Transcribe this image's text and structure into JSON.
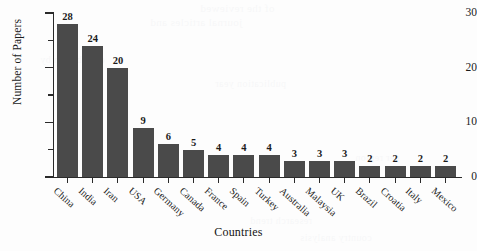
{
  "chart_data": {
    "type": "bar",
    "title": "",
    "xlabel": "Countries",
    "ylabel": "Number of Papers",
    "categories": [
      "China",
      "India",
      "Iran",
      "USA",
      "Germany",
      "Canada",
      "France",
      "Spain",
      "Turkey",
      "Australia",
      "Malaysia",
      "UK",
      "Brazil",
      "Croatia",
      "Italy",
      "Mexico"
    ],
    "values": [
      28,
      24,
      20,
      9,
      6,
      5,
      4,
      4,
      4,
      3,
      3,
      3,
      2,
      2,
      2,
      2
    ],
    "ylim": [
      0,
      30
    ],
    "y_major_ticks": [
      0,
      10,
      20,
      30
    ],
    "y_minor_ticks": [
      5,
      15,
      25
    ],
    "y_tick_labels": [
      "0",
      "10",
      "20",
      "30"
    ],
    "data_labels_shown": true,
    "grid": false,
    "legend": false,
    "bar_color": "#4a4a4a",
    "axis_color": "#2a2a2a",
    "text_color": "#1b1b1b",
    "background_color": "#fdfdfd"
  },
  "bleed_through": {
    "line1": "of the reviewed",
    "line2": "journal articles and",
    "line3": "distribution by",
    "line4": "publication year",
    "line5": "research trend",
    "line6": "country analysis",
    "line7": "per region"
  }
}
